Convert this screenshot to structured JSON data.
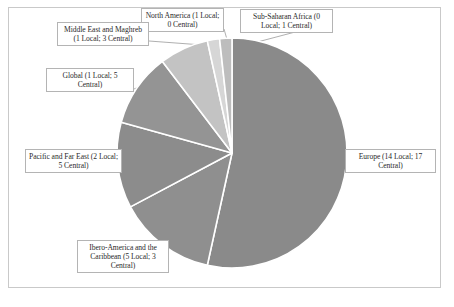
{
  "chart_data": {
    "type": "pie",
    "title": "",
    "subtitle": "",
    "xlabel": "",
    "ylabel": "",
    "legend_position": "callout-labels",
    "grid": false,
    "units": "number of offices",
    "total": 58,
    "start_angle_deg": 0,
    "direction": "clockwise",
    "categories": [
      "Europe",
      "Ibero-America and the Caribbean",
      "Pacific and Far East",
      "Global",
      "Middle East and Maghreb",
      "North America",
      "Sub-Saharan Africa"
    ],
    "values": [
      31,
      8,
      7,
      6,
      4,
      1,
      1
    ],
    "series": [
      {
        "name": "Local",
        "values": [
          14,
          5,
          2,
          1,
          1,
          1,
          0
        ]
      },
      {
        "name": "Central",
        "values": [
          17,
          3,
          5,
          5,
          3,
          0,
          1
        ]
      }
    ],
    "slices": [
      {
        "label": "Europe (14 Local; 17 Central)",
        "name": "Europe",
        "local": 14,
        "central": 17,
        "value": 31,
        "color": "#8a8a8a",
        "start_deg": 0,
        "sweep_deg": 192.41
      },
      {
        "label": "Ibero-America and the Caribbean (5 Local; 3 Central)",
        "name": "Ibero-America and the Caribbean",
        "local": 5,
        "central": 3,
        "value": 8,
        "color": "#8f8f8f",
        "start_deg": 192.41,
        "sweep_deg": 49.66
      },
      {
        "label": "Pacific and Far East (2 Local; 5 Central)",
        "name": "Pacific and Far East",
        "local": 2,
        "central": 5,
        "value": 7,
        "color": "#8c8c8c",
        "start_deg": 242.07,
        "sweep_deg": 43.45
      },
      {
        "label": "Global (1 Local; 5 Central)",
        "name": "Global",
        "local": 1,
        "central": 5,
        "value": 6,
        "color": "#949494",
        "start_deg": 285.52,
        "sweep_deg": 37.24
      },
      {
        "label": "Middle East and Maghreb (1 Local; 3 Central)",
        "name": "Middle East and Maghreb",
        "local": 1,
        "central": 3,
        "value": 4,
        "color": "#c3c3c3",
        "start_deg": 322.76,
        "sweep_deg": 24.83
      },
      {
        "label": "North America (1 Local; 0 Central)",
        "name": "North America",
        "local": 1,
        "central": 0,
        "value": 1,
        "color": "#d6d6d6",
        "start_deg": 347.59,
        "sweep_deg": 6.21
      },
      {
        "label": "Sub-Saharan Africa (0 Local; 1 Central)",
        "name": "Sub-Saharan Africa",
        "local": 0,
        "central": 1,
        "value": 1,
        "color": "#bdbdbd",
        "start_deg": 353.79,
        "sweep_deg": 6.21
      }
    ]
  },
  "callouts": {
    "europe": "Europe (14 Local; 17 Central)",
    "ibero": "Ibero-America and the Caribbean (5 Local; 3 Central)",
    "pacific": "Pacific and Far East (2 Local; 5 Central)",
    "global": "Global (1 Local; 5 Central)",
    "middle_east": "Middle East and Maghreb (1 Local; 3 Central)",
    "north_america": "North America (1 Local; 0 Central)",
    "sub_saharan": "Sub-Saharan Africa (0 Local; 1 Central)"
  },
  "colors": {
    "frame_border": "#c9c9c9",
    "callout_border": "#b4b4b4",
    "slice_separator": "#ffffff",
    "leader_line": "#9a9a9a",
    "background": "#ffffff",
    "text": "#2a2a2a"
  },
  "geometry": {
    "center_x": 232,
    "center_y": 153,
    "radius": 115
  }
}
